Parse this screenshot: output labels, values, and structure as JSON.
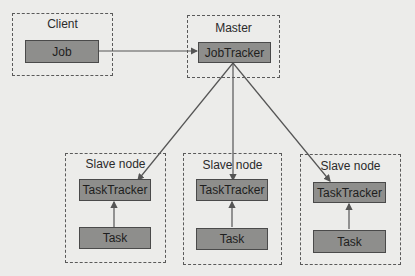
{
  "diagram": {
    "client": {
      "label": "Client",
      "node": "Job"
    },
    "master": {
      "label": "Master",
      "node": "JobTracker"
    },
    "slaves": [
      {
        "label": "Slave node",
        "tracker": "TaskTracker",
        "task": "Task"
      },
      {
        "label": "Slave node",
        "tracker": "TaskTracker",
        "task": "Task"
      },
      {
        "label": "Slave node",
        "tracker": "TaskTracker",
        "task": "Task"
      }
    ],
    "colors": {
      "node_fill": "#8e8e8c",
      "border": "#4a4a4a",
      "background": "#ececea",
      "line": "#555555"
    }
  }
}
